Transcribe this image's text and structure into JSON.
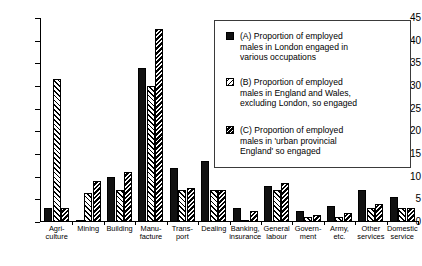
{
  "chart_data": {
    "type": "bar",
    "title": "",
    "subtitle": "",
    "xlabel": "",
    "ylabel": "",
    "ylim": [
      0,
      45
    ],
    "yticks": [
      0,
      5,
      10,
      15,
      20,
      25,
      30,
      35,
      40,
      45
    ],
    "grid": false,
    "legend_position": "upper-right",
    "categories": [
      "Agri-\nculture",
      "Mining",
      "Building",
      "Manu-\nfacture",
      "Trans-\nport",
      "Dealing",
      "Banking,\ninsurance",
      "General\nlabour",
      "Govern-\nment",
      "Army,\netc.",
      "Other\nservices",
      "Domestic\nservice"
    ],
    "series": [
      {
        "name": "(A)",
        "label": "(A)  Proportion of employed males in London engaged in various occupations",
        "pattern": "solid-black",
        "color": "#111111",
        "values": [
          3.0,
          0.5,
          10.0,
          34.0,
          12.0,
          13.5,
          3.0,
          8.0,
          2.5,
          3.5,
          7.0,
          5.5
        ]
      },
      {
        "name": "(B)",
        "label": "(B)  Proportion of employed males in England and Wales, excluding London, so engaged",
        "pattern": "light-diagonal-hatch",
        "color": "#ffffff",
        "values": [
          31.5,
          6.3,
          7.0,
          30.0,
          7.0,
          7.0,
          0.5,
          7.0,
          1.0,
          1.0,
          3.0,
          3.0
        ]
      },
      {
        "name": "(C)",
        "label": "(C)  Proportion of employed males in 'urban provincial England' so engaged",
        "pattern": "dense-diagonal-hatch",
        "color": "#ffffff",
        "values": [
          3.0,
          9.0,
          11.0,
          42.5,
          7.5,
          7.0,
          2.5,
          8.5,
          1.5,
          2.0,
          4.0,
          3.0
        ]
      }
    ]
  },
  "legend": {
    "items": [
      {
        "swatch": "solid-black",
        "text": "(A)  Proportion of employed\nmales in London engaged in\nvarious occupations"
      },
      {
        "swatch": "light-diagonal-hatch",
        "text": "(B)  Proportion of employed\nmales in England and Wales,\nexcluding London, so engaged"
      },
      {
        "swatch": "dense-diagonal-hatch",
        "text": "(C)  Proportion of employed\nmales in 'urban provincial\nEngland' so engaged"
      }
    ]
  }
}
